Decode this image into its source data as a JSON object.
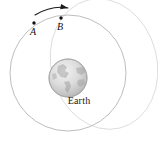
{
  "figure": {
    "background_color": "#ffffff",
    "width": 158,
    "height": 142
  },
  "body": {
    "name": "Earth",
    "label": "Earth",
    "center_x": 68,
    "center_y": 78,
    "radius": 19,
    "fill_color": "#d8d8d8",
    "outline_color": "#9a9a9a"
  },
  "orbits": [
    {
      "name": "circular-parking-orbit",
      "type": "circle",
      "center_x": 68,
      "center_y": 73,
      "radius": 58,
      "stroke_color": "#b5b5b5",
      "stroke_width": 0.9
    },
    {
      "name": "transfer-ellipse",
      "type": "ellipse",
      "center_x": 104,
      "center_y": 64,
      "radius_x": 53,
      "radius_y": 66,
      "rotation_deg": -14,
      "stroke_color": "#dcdcdc",
      "stroke_width": 0.9
    }
  ],
  "points": [
    {
      "name": "point-A",
      "label": "A",
      "x": 34,
      "y": 23,
      "dot_radius": 1.7,
      "color": "#111111"
    },
    {
      "name": "point-B",
      "label": "B",
      "x": 61,
      "y": 18,
      "dot_radius": 1.7,
      "color": "#111111"
    }
  ],
  "direction_arrow": {
    "name": "direction-of-motion-arrow",
    "description": "curved arrow showing direction of travel from A toward B",
    "start_x": 35,
    "start_y": 15,
    "control_x": 52,
    "control_y": 5,
    "end_x": 68,
    "end_y": 8,
    "color": "#1a1a1a",
    "stroke_width": 1.1
  }
}
